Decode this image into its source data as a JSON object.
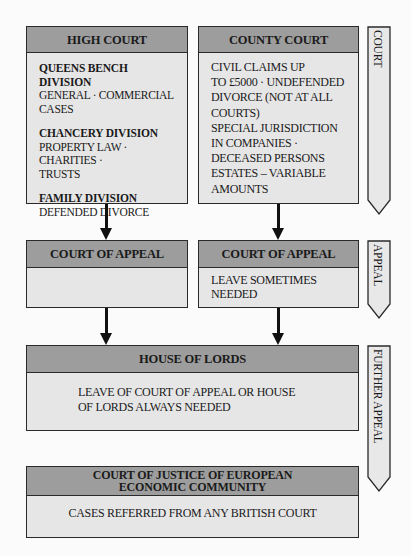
{
  "high_court": {
    "title": "HIGH COURT",
    "divisions": [
      {
        "name": "QUEENS BENCH DIVISION",
        "line1": "GENERAL · COMMERCIAL",
        "line2": "CASES"
      },
      {
        "name": "CHANCERY DIVISION",
        "line1": "PROPERTY LAW · CHARITIES ·",
        "line2": "TRUSTS"
      },
      {
        "name": "FAMILY DIVISION",
        "line1": "DEFENDED DIVORCE",
        "line2": ""
      }
    ]
  },
  "county_court": {
    "title": "COUNTY COURT",
    "lines": [
      "CIVIL CLAIMS UP",
      "TO £5000 · UNDEFENDED",
      "DIVORCE (NOT AT ALL",
      "COURTS)",
      "SPECIAL JURISDICTION",
      "IN COMPANIES ·",
      "DECEASED PERSONS",
      "ESTATES – VARIABLE",
      "AMOUNTS"
    ]
  },
  "court_of_appeal_left": {
    "title": "COURT OF APPEAL",
    "text": ""
  },
  "court_of_appeal_right": {
    "title": "COURT OF APPEAL",
    "line1": "LEAVE SOMETIMES",
    "line2": "NEEDED"
  },
  "house_of_lords": {
    "title": "HOUSE OF LORDS",
    "line1": "LEAVE OF COURT OF APPEAL OR HOUSE",
    "line2": "OF LORDS ALWAYS NEEDED"
  },
  "european_court": {
    "title_line1": "COURT OF JUSTICE OF EUROPEAN",
    "title_line2": "ECONOMIC COMMUNITY",
    "text": "CASES REFERRED FROM ANY BRITISH COURT"
  },
  "side_labels": {
    "court": "COURT",
    "appeal": "APPEAL",
    "further_appeal": "FURTHER APPEAL"
  },
  "colors": {
    "header_fill": "#9d9d9d",
    "body_fill": "#e6e6e6",
    "border": "#2a2a2a",
    "arrow": "#111111",
    "background": "#fbfbfb"
  }
}
